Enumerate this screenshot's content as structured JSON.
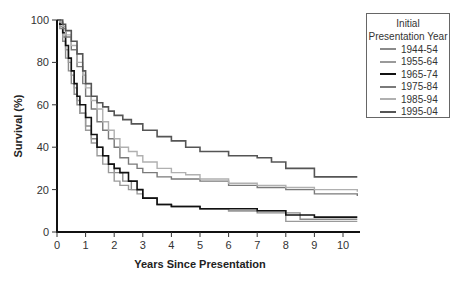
{
  "chart_data": {
    "type": "line",
    "subtype": "kaplan-meier step survival curves",
    "title": "",
    "xlabel": "Years Since Presentation",
    "ylabel": "Survival (%)",
    "xlim": [
      0,
      10.5
    ],
    "ylim": [
      0,
      100
    ],
    "xticks": [
      0,
      1,
      2,
      3,
      4,
      5,
      6,
      7,
      8,
      9,
      10
    ],
    "yticks": [
      0,
      20,
      40,
      60,
      80,
      100
    ],
    "grid": false,
    "legend": {
      "title_line1": "Initial",
      "title_line2": "Presentation Year",
      "position": "right"
    },
    "series": [
      {
        "name": "1944-54",
        "color": "#8a8a8a",
        "width": 1.4,
        "x": [
          0,
          0.1,
          0.2,
          0.3,
          0.4,
          0.5,
          0.6,
          0.7,
          0.8,
          1.0,
          1.2,
          1.4,
          1.6,
          1.8,
          2.0,
          2.3,
          2.6,
          3.0,
          3.5,
          4.0,
          5.0,
          6.0,
          7.0,
          8.0,
          8.5,
          9.0,
          10.5
        ],
        "y": [
          100,
          96,
          90,
          82,
          76,
          70,
          65,
          60,
          56,
          50,
          44,
          40,
          36,
          32,
          28,
          24,
          20,
          16,
          13,
          12,
          11,
          10,
          9,
          9,
          6,
          6,
          6
        ]
      },
      {
        "name": "1955-64",
        "color": "#9a9a9a",
        "width": 1.4,
        "x": [
          0,
          0.1,
          0.2,
          0.3,
          0.4,
          0.5,
          0.6,
          0.7,
          0.8,
          1.0,
          1.2,
          1.4,
          1.6,
          1.8,
          2.0,
          2.2,
          2.5,
          2.8,
          3.0,
          3.5,
          4.0,
          5.0,
          6.0,
          7.0,
          8.0,
          10.5
        ],
        "y": [
          100,
          97,
          92,
          86,
          80,
          74,
          68,
          62,
          56,
          48,
          42,
          36,
          32,
          28,
          24,
          22,
          20,
          18,
          16,
          13,
          12,
          11,
          10,
          10,
          5,
          5
        ]
      },
      {
        "name": "1965-74",
        "color": "#111111",
        "width": 1.6,
        "x": [
          0,
          0.1,
          0.2,
          0.3,
          0.4,
          0.5,
          0.6,
          0.7,
          0.8,
          1.0,
          1.2,
          1.4,
          1.6,
          1.8,
          2.0,
          2.2,
          2.5,
          2.8,
          3.0,
          3.5,
          4.0,
          5.0,
          6.0,
          7.0,
          8.0,
          9.0,
          10.5
        ],
        "y": [
          100,
          98,
          94,
          88,
          82,
          76,
          70,
          64,
          60,
          54,
          46,
          40,
          36,
          32,
          30,
          28,
          24,
          20,
          16,
          13,
          12,
          11,
          11,
          10,
          8,
          7,
          7
        ]
      },
      {
        "name": "1975-84",
        "color": "#7a7a7a",
        "width": 1.4,
        "x": [
          0,
          0.1,
          0.2,
          0.3,
          0.5,
          0.7,
          0.9,
          1.0,
          1.2,
          1.4,
          1.6,
          1.8,
          2.0,
          2.2,
          2.5,
          2.8,
          3.0,
          3.5,
          4.0,
          5.0,
          6.0,
          7.0,
          8.0,
          9.0,
          10.5
        ],
        "y": [
          100,
          99,
          96,
          92,
          86,
          78,
          70,
          64,
          58,
          52,
          48,
          44,
          40,
          35,
          32,
          30,
          28,
          26,
          25,
          24,
          22,
          21,
          20,
          18,
          17
        ]
      },
      {
        "name": "1985-94",
        "color": "#b0b0b0",
        "width": 1.4,
        "x": [
          0,
          0.1,
          0.2,
          0.3,
          0.5,
          0.7,
          0.9,
          1.0,
          1.2,
          1.4,
          1.6,
          1.8,
          2.0,
          2.2,
          2.5,
          2.8,
          3.0,
          3.5,
          4.0,
          4.5,
          5.0,
          6.0,
          7.0,
          8.0,
          9.0,
          10.5
        ],
        "y": [
          100,
          99,
          97,
          93,
          88,
          80,
          74,
          68,
          62,
          58,
          52,
          48,
          44,
          40,
          38,
          36,
          33,
          30,
          28,
          27,
          25,
          23,
          22,
          21,
          20,
          19
        ]
      },
      {
        "name": "1995-04",
        "color": "#555555",
        "width": 1.6,
        "x": [
          0,
          0.1,
          0.2,
          0.3,
          0.5,
          0.7,
          0.9,
          1.0,
          1.2,
          1.4,
          1.6,
          1.8,
          2.0,
          2.3,
          2.6,
          3.0,
          3.5,
          4.0,
          4.5,
          5.0,
          6.0,
          7.0,
          7.5,
          8.0,
          9.0,
          10.5
        ],
        "y": [
          100,
          100,
          98,
          95,
          90,
          84,
          76,
          70,
          64,
          61,
          59,
          57,
          55,
          53,
          51,
          48,
          45,
          43,
          40,
          38,
          36,
          35,
          33,
          30,
          26,
          26
        ]
      }
    ]
  }
}
